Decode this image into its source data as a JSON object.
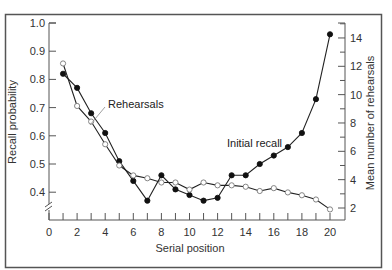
{
  "chart_data": {
    "type": "line",
    "title": "",
    "xlabel": "Serial position",
    "ylabel": "Recall probability",
    "y2label": "Mean number of rehearsals",
    "x": [
      1,
      2,
      3,
      4,
      5,
      6,
      7,
      8,
      9,
      10,
      11,
      12,
      13,
      14,
      15,
      16,
      17,
      18,
      19,
      20
    ],
    "xlim": [
      0,
      20
    ],
    "ylim": [
      0.35,
      1.0
    ],
    "y2lim": [
      1.8,
      14.8
    ],
    "x_ticks": [
      "0",
      "2",
      "4",
      "6",
      "8",
      "10",
      "12",
      "14",
      "16",
      "18",
      "20"
    ],
    "y_ticks": [
      "0.4",
      "0.5",
      "0.6",
      "0.7",
      "0.8",
      "0.9",
      "1.0"
    ],
    "y2_ticks": [
      "2",
      "4",
      "6",
      "8",
      "10",
      "12",
      "14"
    ],
    "grid": false,
    "legend": "inline annotations",
    "series": [
      {
        "name": "Initial recall",
        "axis": "left",
        "marker": "filled-circle",
        "values": [
          0.82,
          0.77,
          0.68,
          0.61,
          0.51,
          0.44,
          0.37,
          0.46,
          0.41,
          0.39,
          0.37,
          0.38,
          0.46,
          0.46,
          0.5,
          0.53,
          0.56,
          0.61,
          0.73,
          0.96
        ]
      },
      {
        "name": "Rehearsals",
        "axis": "right",
        "marker": "open-circle",
        "values": [
          12.2,
          9.2,
          8.1,
          6.5,
          5.0,
          4.3,
          4.1,
          3.8,
          3.8,
          3.3,
          3.8,
          3.6,
          3.6,
          3.5,
          3.2,
          3.4,
          3.1,
          2.9,
          2.6,
          1.9
        ]
      }
    ],
    "annotations": [
      {
        "text": "Rehearsals"
      },
      {
        "text": "Initial recall"
      }
    ]
  },
  "labels": {
    "xlabel": "Serial position",
    "ylabel": "Recall probability",
    "y2label": "Mean number of rehearsals",
    "rehearsals": "Rehearsals",
    "initial_recall": "Initial recall"
  }
}
